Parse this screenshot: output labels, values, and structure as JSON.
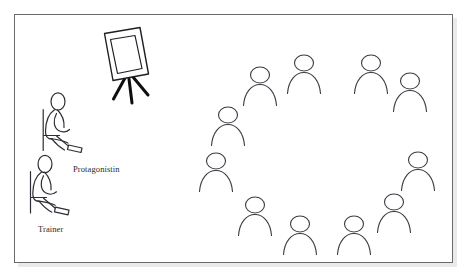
{
  "page": {
    "top_caption": "",
    "background_color": "#ffffff",
    "frame": {
      "x": 14,
      "y": 14,
      "width": 439,
      "height": 249,
      "border_color": "#595959",
      "fill_color": "#ffffff",
      "shadow_color": "#d0d0d0"
    }
  },
  "labels": {
    "protagonistin": "Protagonistin",
    "trainer": "Trainer"
  },
  "scene": {
    "stroke_color": "#3a3a42",
    "leg_color": "#1a1a1a",
    "easel": {
      "name": "flipchart-easel",
      "board_outer": [
        [
          104.5,
          33.5
        ],
        [
          140.0,
          27.5
        ],
        [
          148.5,
          74.0
        ],
        [
          113.0,
          80.5
        ]
      ],
      "board_inner": [
        [
          110.0,
          39.0
        ],
        [
          135.5,
          34.5
        ],
        [
          142.5,
          69.0
        ],
        [
          117.5,
          74.0
        ]
      ],
      "legs": [
        {
          "x1": 125.0,
          "y1": 78.0,
          "x2": 113.5,
          "y2": 99.0
        },
        {
          "x1": 129.0,
          "y1": 78.5,
          "x2": 132.0,
          "y2": 103.0
        },
        {
          "x1": 133.0,
          "y1": 77.0,
          "x2": 148.0,
          "y2": 95.0
        }
      ]
    },
    "seated_figures": [
      {
        "name": "protagonistin-figure",
        "label": "Protagonistin",
        "head": {
          "cx": 58.0,
          "cy": 101.5,
          "rx": 7.0,
          "ry": 8.5
        },
        "chair": {
          "back_x": 42.5,
          "back_y1": 109.0,
          "back_y2": 149.0,
          "seat_x2": 57.0,
          "seat_y": 135.0
        },
        "body": "torso-arc",
        "arm": "bent-forward",
        "legs": "extended-right",
        "shoe": {
          "x": 68.0,
          "y": 146.0,
          "w": 14.0,
          "h": 6.0
        }
      },
      {
        "name": "trainer-figure",
        "label": "Trainer",
        "head": {
          "cx": 45.0,
          "cy": 164.0,
          "rx": 7.0,
          "ry": 8.5
        },
        "chair": {
          "back_x": 32.0,
          "back_y1": 171.0,
          "back_y2": 212.0,
          "seat_x2": 45.0,
          "seat_y": 197.0
        },
        "body": "torso-arc",
        "arm": "bent-forward",
        "legs": "extended-right",
        "shoe": {
          "x": 56.0,
          "y": 208.0,
          "w": 14.0,
          "h": 6.0
        }
      }
    ],
    "circle_group": {
      "name": "participant-circle",
      "count": 12,
      "members": [
        {
          "id": 1,
          "head_cx": 260.0,
          "head_cy": 75.0,
          "rx": 9.5,
          "ry": 8.0
        },
        {
          "id": 2,
          "head_cx": 304.0,
          "head_cy": 63.0,
          "rx": 9.5,
          "ry": 8.0
        },
        {
          "id": 3,
          "head_cx": 371.0,
          "head_cy": 63.0,
          "rx": 9.5,
          "ry": 8.0
        },
        {
          "id": 4,
          "head_cx": 410.0,
          "head_cy": 81.0,
          "rx": 9.5,
          "ry": 8.0
        },
        {
          "id": 5,
          "head_cx": 228.0,
          "head_cy": 115.0,
          "rx": 9.5,
          "ry": 8.0
        },
        {
          "id": 6,
          "head_cx": 418.0,
          "head_cy": 160.0,
          "rx": 9.5,
          "ry": 8.0
        },
        {
          "id": 7,
          "head_cx": 216.0,
          "head_cy": 161.0,
          "rx": 9.5,
          "ry": 8.0
        },
        {
          "id": 8,
          "head_cx": 394.0,
          "head_cy": 202.0,
          "rx": 9.5,
          "ry": 8.0
        },
        {
          "id": 9,
          "head_cx": 255.0,
          "head_cy": 205.0,
          "rx": 9.5,
          "ry": 8.0
        },
        {
          "id": 10,
          "head_cx": 300.0,
          "head_cy": 224.0,
          "rx": 9.5,
          "ry": 8.0
        },
        {
          "id": 11,
          "head_cx": 354.0,
          "head_cy": 224.0,
          "rx": 9.5,
          "ry": 8.0
        },
        {
          "id": 12,
          "head_cx": 243.0,
          "head_cy": 222.0,
          "rx": 9.5,
          "ry": 8.0
        }
      ]
    }
  }
}
